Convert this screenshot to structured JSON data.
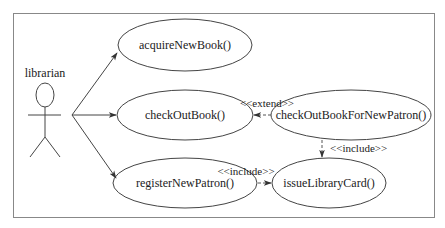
{
  "diagram": {
    "type": "uml-use-case",
    "actor": {
      "name": "librarian"
    },
    "use_cases": [
      {
        "id": "acquire",
        "label": "acquireNewBook()"
      },
      {
        "id": "checkout",
        "label": "checkOutBook()"
      },
      {
        "id": "register",
        "label": "registerNewPatron()"
      },
      {
        "id": "checkoutNew",
        "label": "checkOutBookForNewPatron()"
      },
      {
        "id": "issue",
        "label": "issueLibraryCard()"
      }
    ],
    "relationships": [
      {
        "from": "librarian",
        "to": "acquire",
        "kind": "association"
      },
      {
        "from": "librarian",
        "to": "checkout",
        "kind": "association"
      },
      {
        "from": "librarian",
        "to": "register",
        "kind": "association"
      },
      {
        "from": "checkoutNew",
        "to": "checkout",
        "kind": "extend",
        "label": "<<extend>>"
      },
      {
        "from": "checkoutNew",
        "to": "issue",
        "kind": "include",
        "label": "<<include>>"
      },
      {
        "from": "register",
        "to": "issue",
        "kind": "include",
        "label": "<<include>>"
      }
    ]
  }
}
